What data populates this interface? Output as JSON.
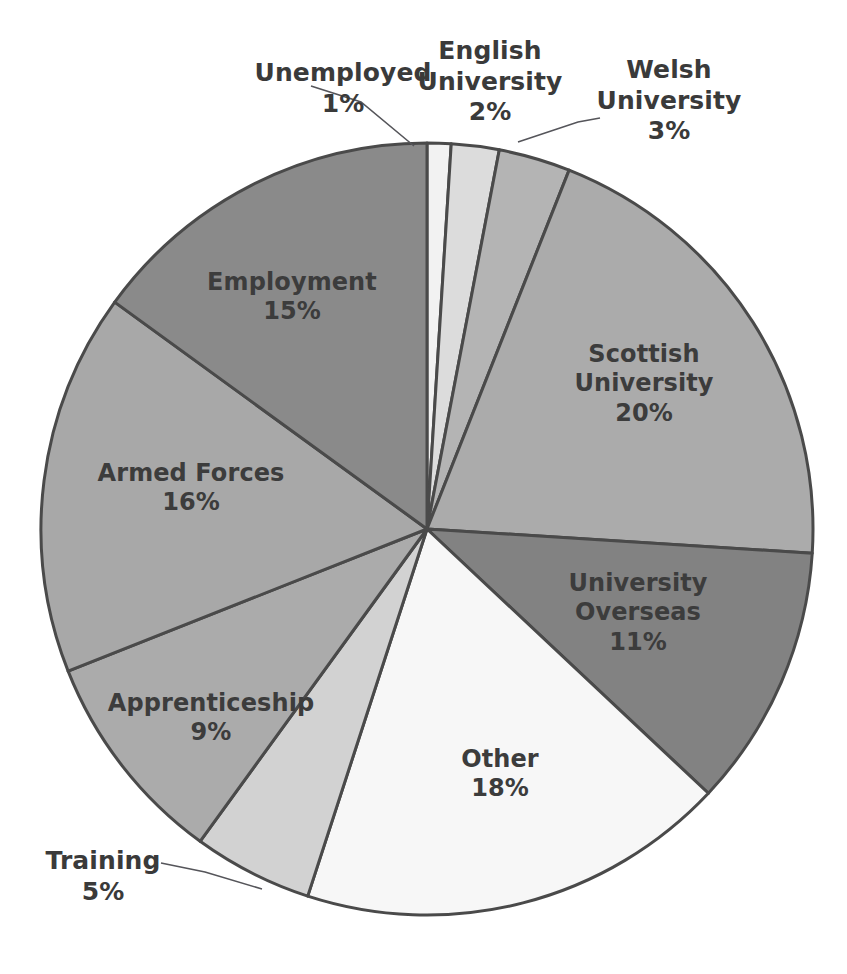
{
  "chart_data": {
    "type": "pie",
    "title": "",
    "subtitle": "",
    "xlabel": "",
    "ylabel": "",
    "legend_position": "none",
    "grid": false,
    "units": "percent",
    "total": 100,
    "start_angle_deg": 0,
    "direction": "clockwise",
    "categories": [
      "Unemployed",
      "English University",
      "Welsh University",
      "Scottish University",
      "University Overseas",
      "Other",
      "Training",
      "Apprenticeship",
      "Armed Forces",
      "Employment"
    ],
    "values": [
      1,
      2,
      3,
      20,
      11,
      18,
      5,
      9,
      16,
      15
    ],
    "slices": [
      {
        "name": "Unemployed",
        "label_lines": "Unemployed",
        "value": 1,
        "value_label": "1%",
        "color": "#f2f2f2",
        "label_placement": "outside",
        "label_x": 248,
        "label_y": 58,
        "label_width": 190,
        "leader": {
          "x1": 311,
          "y1": 86,
          "x2": 361,
          "y2": 102,
          "x3": 414,
          "y3": 146
        }
      },
      {
        "name": "English University",
        "label_lines": "English\nUniversity",
        "value": 2,
        "value_label": "2%",
        "color": "#dcdcdc",
        "label_placement": "outside",
        "label_x": 400,
        "label_y": 36,
        "label_width": 180,
        "leader": null
      },
      {
        "name": "Welsh University",
        "label_lines": "Welsh\nUniversity",
        "value": 3,
        "value_label": "3%",
        "color": "#b4b4b4",
        "label_placement": "outside",
        "label_x": 574,
        "label_y": 55,
        "label_width": 190,
        "leader": {
          "x1": 600,
          "y1": 118,
          "x2": 578,
          "y2": 122,
          "x3": 518,
          "y3": 142
        }
      },
      {
        "name": "Scottish University",
        "label_lines": "Scottish\nUniversity",
        "value": 20,
        "value_label": "20%",
        "color": "#ababab",
        "label_placement": "inside",
        "label_x": 549,
        "label_y": 340,
        "label_width": 190,
        "leader": null
      },
      {
        "name": "University Overseas",
        "label_lines": "University\nOverseas",
        "value": 11,
        "value_label": "11%",
        "color": "#828282",
        "label_placement": "inside",
        "label_x": 543,
        "label_y": 569,
        "label_width": 190,
        "leader": null
      },
      {
        "name": "Other",
        "label_lines": "Other",
        "value": 18,
        "value_label": "18%",
        "color": "#f7f7f7",
        "label_placement": "inside",
        "label_x": 405,
        "label_y": 745,
        "label_width": 190,
        "leader": null
      },
      {
        "name": "Training",
        "label_lines": "Training",
        "value": 5,
        "value_label": "5%",
        "color": "#d2d2d2",
        "label_placement": "outside",
        "label_x": 18,
        "label_y": 846,
        "label_width": 170,
        "leader": {
          "x1": 161,
          "y1": 863,
          "x2": 205,
          "y2": 872,
          "x3": 262,
          "y3": 889
        }
      },
      {
        "name": "Apprenticeship",
        "label_lines": "Apprenticeship",
        "value": 9,
        "value_label": "9%",
        "color": "#ababab",
        "label_placement": "inside",
        "label_x": 106,
        "label_y": 689,
        "label_width": 210,
        "leader": null
      },
      {
        "name": "Armed Forces",
        "label_lines": "Armed Forces",
        "value": 16,
        "value_label": "16%",
        "color": "#a8a8a8",
        "label_placement": "inside",
        "label_x": 86,
        "label_y": 459,
        "label_width": 210,
        "leader": null
      },
      {
        "name": "Employment",
        "label_lines": "Employment",
        "value": 15,
        "value_label": "15%",
        "color": "#8a8a8a",
        "label_placement": "inside",
        "label_x": 192,
        "label_y": 268,
        "label_width": 200,
        "leader": null
      }
    ],
    "geometry": {
      "center_x": 427,
      "center_y": 529,
      "radius": 386
    },
    "style": {
      "slice_border_color": "#4a4a4a",
      "label_text_color": "#3c3c3c",
      "leader_line_color": "#55555a",
      "background": "#ffffff"
    }
  },
  "artifacts": {
    "top_cropped_text": "· ·"
  }
}
